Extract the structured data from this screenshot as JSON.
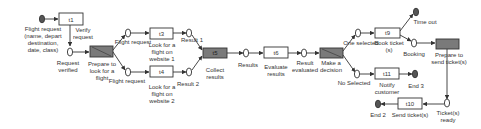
{
  "diagram": {
    "type": "petri-net-workflow",
    "colors": {
      "line": "#333333",
      "transition_fill": "#ffffff",
      "gray_transition_fill": "#7a7a7a",
      "end_place_fill": "#555555"
    },
    "transitions": [
      {
        "id": "t1",
        "label": "t1",
        "caption": "Verify\nrequest"
      },
      {
        "id": "prepare",
        "label": "t2",
        "caption": "Prepare to\nlook for a\nflight",
        "gray": true
      },
      {
        "id": "t3",
        "label": "t3",
        "caption": "Look for a\nflight on\nwebsite 1"
      },
      {
        "id": "t4",
        "label": "t4",
        "caption": "Look for a\nflight on\nwebsite 2"
      },
      {
        "id": "t5",
        "label": "t5",
        "caption": "Collect\nresults",
        "gray": true
      },
      {
        "id": "t6",
        "label": "t6",
        "caption": "Evaluate\nresults"
      },
      {
        "id": "decision",
        "label": "t7",
        "caption": "Make a\ndecision",
        "gray": true
      },
      {
        "id": "t9",
        "label": "t9",
        "caption": "Book ticket\n(s)"
      },
      {
        "id": "prepare_send",
        "label": "t8",
        "caption": "Prepare to\nsend ticket(s)",
        "gray": true
      },
      {
        "id": "t11",
        "label": "t11",
        "caption": "Notify\ncustomer"
      },
      {
        "id": "t10",
        "label": "t10",
        "caption": "Send ticket(s)"
      }
    ],
    "places": [
      {
        "id": "start",
        "caption": "Flight request\n(name, depart\ndestination,\ndate, class)",
        "filled": true
      },
      {
        "id": "p_verified",
        "caption": "Request\nverified"
      },
      {
        "id": "p_fr1",
        "caption": "Flight request"
      },
      {
        "id": "p_fr2",
        "caption": "Flight request"
      },
      {
        "id": "p_r1",
        "caption": "Result 1"
      },
      {
        "id": "p_r2",
        "caption": "Result 2"
      },
      {
        "id": "p_results",
        "caption": "Results"
      },
      {
        "id": "p_evaluated",
        "caption": "Result\nevaluated"
      },
      {
        "id": "p_one",
        "caption": "One selected"
      },
      {
        "id": "p_no",
        "caption": "No Selected"
      },
      {
        "id": "p_timeout",
        "caption": "Time out",
        "filled": true
      },
      {
        "id": "p_booking",
        "caption": "Booking"
      },
      {
        "id": "p_end3",
        "caption": "End 3",
        "filled": true
      },
      {
        "id": "p_ready",
        "caption": "Ticket(s)\nready"
      },
      {
        "id": "p_end2",
        "caption": "End 2",
        "filled": true
      }
    ]
  }
}
